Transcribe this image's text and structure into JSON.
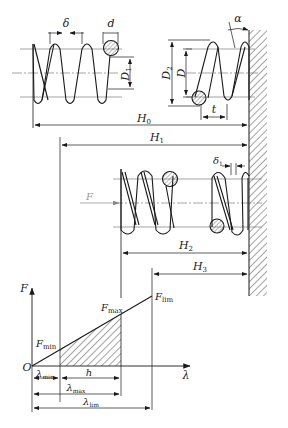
{
  "colors": {
    "line": "#1a1a1a",
    "center_line": "#555555",
    "force_arrow": "#999999",
    "background": "#ffffff"
  },
  "labels": {
    "delta": {
      "main": "δ",
      "sub": ""
    },
    "d": {
      "main": "d",
      "sub": ""
    },
    "D1": {
      "main": "D",
      "sub": "1"
    },
    "D2": {
      "main": "D",
      "sub": "2"
    },
    "D": {
      "main": "D",
      "sub": ""
    },
    "t": {
      "main": "t",
      "sub": ""
    },
    "alpha": {
      "main": "α",
      "sub": ""
    },
    "H0": {
      "main": "H",
      "sub": "0"
    },
    "H1": {
      "main": "H",
      "sub": "1"
    },
    "H2": {
      "main": "H",
      "sub": "2"
    },
    "H3": {
      "main": "H",
      "sub": "3"
    },
    "delta1": {
      "main": "δ",
      "sub": "1"
    },
    "F_arrow": {
      "main": "F",
      "sub": ""
    },
    "F_axis": {
      "main": "F",
      "sub": ""
    },
    "lambda_axis": {
      "main": "λ",
      "sub": ""
    },
    "origin": {
      "main": "O",
      "sub": ""
    },
    "Fmin": {
      "main": "F",
      "sub": "min"
    },
    "Fmax": {
      "main": "F",
      "sub": "max"
    },
    "Flim": {
      "main": "F",
      "sub": "lim"
    },
    "lambda_min": {
      "main": "λ",
      "sub": "min"
    },
    "h": {
      "main": "h",
      "sub": ""
    },
    "lambda_max": {
      "main": "λ",
      "sub": "max"
    },
    "lambda_lim": {
      "main": "λ",
      "sub": "lim"
    }
  }
}
